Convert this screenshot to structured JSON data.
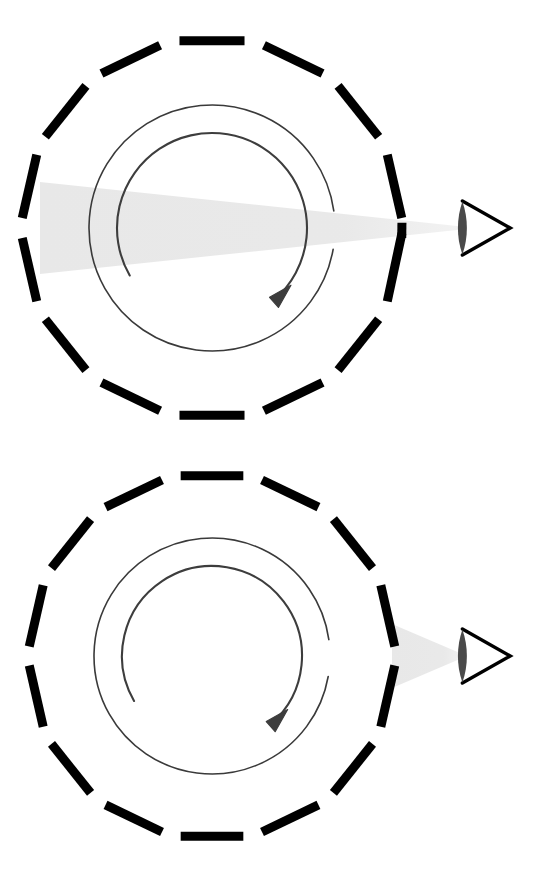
{
  "document": {
    "title": "Rotating slotted drum observed by an eye",
    "background_color": "#ffffff",
    "width": 555,
    "height": 880,
    "panel_count": 2
  },
  "palette": {
    "ink": "#000000",
    "thin_line": "#3a3a3a",
    "arrow": "#3d3d3d",
    "beam": "#e8e8e8",
    "pupil": "#4a4a4a",
    "background": "#ffffff"
  },
  "panels": [
    {
      "id": "panel-top",
      "label": "wide-beam-configuration",
      "center": {
        "x": 212,
        "y": 228
      },
      "drum": {
        "name": "slotted-drum",
        "segment_count": 14,
        "outer_radius": 190,
        "segment_thickness": 9,
        "segment_gap_degrees": 6,
        "rotation_offset_degrees": 12.857,
        "color": "#000000",
        "slit": {
          "present": true,
          "at_degrees": 0,
          "half_width_degrees": 1.6,
          "description": "narrow viewing slit on the right side of the drum"
        }
      },
      "inner_circle": {
        "name": "rotation-path-circle",
        "radius": 123,
        "stroke_width": 1.6,
        "color": "#3a3a3a",
        "gap_start_degrees": -8,
        "gap_end_degrees": 10
      },
      "rotation_arrow": {
        "name": "clockwise-rotation-arrow",
        "direction": "clockwise",
        "head_angle_degrees": 49,
        "color": "#3d3d3d"
      },
      "light_beam": {
        "name": "light-cone",
        "shape": "wedge",
        "source_edge": "left-segment",
        "apex": "eye-pupil",
        "near_half_height": 46,
        "near_x": 40,
        "far_x": 470,
        "color": "#e8e8e8",
        "description": "wide converging cone spanning the full drum aperture"
      },
      "eye": {
        "name": "observer-eye",
        "x": 478,
        "y": 228,
        "size": 52,
        "outline_color": "#000000",
        "pupil_color": "#4a4a4a"
      }
    },
    {
      "id": "panel-bottom",
      "label": "narrow-beam-configuration",
      "center": {
        "x": 212,
        "y": 216
      },
      "drum": {
        "name": "slotted-drum",
        "segment_count": 14,
        "outer_radius": 183,
        "segment_thickness": 9,
        "segment_gap_degrees": 6,
        "rotation_offset_degrees": 12.857,
        "color": "#000000",
        "slit": {
          "present": false,
          "at_degrees": 0,
          "half_width_degrees": 0,
          "description": "no slit; beam originates at the solid right-hand segment"
        }
      },
      "inner_circle": {
        "name": "rotation-path-circle",
        "radius": 118,
        "stroke_width": 1.6,
        "color": "#3a3a3a",
        "gap_start_degrees": -8,
        "gap_end_degrees": 10
      },
      "rotation_arrow": {
        "name": "clockwise-rotation-arrow",
        "direction": "clockwise",
        "head_angle_degrees": 49,
        "color": "#3d3d3d"
      },
      "light_beam": {
        "name": "light-cone",
        "shape": "wedge",
        "source_edge": "right-segment",
        "apex": "eye-pupil",
        "near_half_height": 32,
        "near_x": 392,
        "far_x": 470,
        "color": "#e8e8e8",
        "description": "short narrow cone from the right segment to the eye"
      },
      "eye": {
        "name": "observer-eye",
        "x": 478,
        "y": 216,
        "size": 52,
        "outline_color": "#000000",
        "pupil_color": "#4a4a4a"
      }
    }
  ],
  "chart_data": {
    "type": "diagram",
    "panels": [
      {
        "name": "wide-beam-configuration",
        "beam_half_angle_note": "cone subtends the whole drum diameter at the left wall",
        "drum_segments": 14,
        "has_slit": true
      },
      {
        "name": "narrow-beam-configuration",
        "beam_half_angle_note": "cone is confined between the right wall and the eye",
        "drum_segments": 14,
        "has_slit": false
      }
    ],
    "annotations": []
  }
}
